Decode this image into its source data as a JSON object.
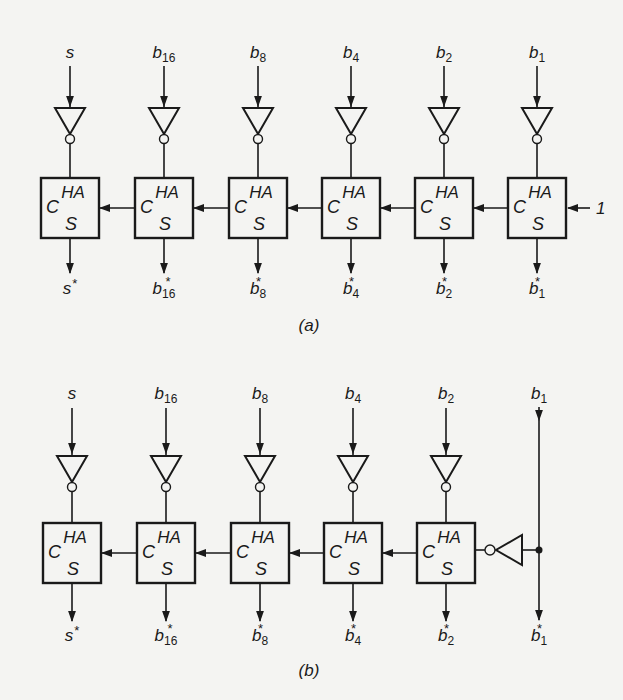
{
  "figure": {
    "panel_a": {
      "caption": "(a)",
      "stages": [
        {
          "input": "s",
          "input_sub": "",
          "output": "s",
          "output_sub": "",
          "box_title": "HA",
          "carry": "C",
          "sum": "S"
        },
        {
          "input": "b",
          "input_sub": "16",
          "output": "b",
          "output_sub": "16",
          "box_title": "HA",
          "carry": "C",
          "sum": "S"
        },
        {
          "input": "b",
          "input_sub": "8",
          "output": "b",
          "output_sub": "8",
          "box_title": "HA",
          "carry": "C",
          "sum": "S"
        },
        {
          "input": "b",
          "input_sub": "4",
          "output": "b",
          "output_sub": "4",
          "box_title": "HA",
          "carry": "C",
          "sum": "S"
        },
        {
          "input": "b",
          "input_sub": "2",
          "output": "b",
          "output_sub": "2",
          "box_title": "HA",
          "carry": "C",
          "sum": "S"
        },
        {
          "input": "b",
          "input_sub": "1",
          "output": "b",
          "output_sub": "1",
          "box_title": "HA",
          "carry": "C",
          "sum": "S"
        }
      ],
      "carry_in": "1",
      "star": "*"
    },
    "panel_b": {
      "caption": "(b)",
      "stages": [
        {
          "input": "s",
          "input_sub": "",
          "output": "s",
          "output_sub": "",
          "box_title": "HA",
          "carry": "C",
          "sum": "S"
        },
        {
          "input": "b",
          "input_sub": "16",
          "output": "b",
          "output_sub": "16",
          "box_title": "HA",
          "carry": "C",
          "sum": "S"
        },
        {
          "input": "b",
          "input_sub": "8",
          "output": "b",
          "output_sub": "8",
          "box_title": "HA",
          "carry": "C",
          "sum": "S"
        },
        {
          "input": "b",
          "input_sub": "4",
          "output": "b",
          "output_sub": "4",
          "box_title": "HA",
          "carry": "C",
          "sum": "S"
        },
        {
          "input": "b",
          "input_sub": "2",
          "output": "b",
          "output_sub": "2",
          "box_title": "HA",
          "carry": "C",
          "sum": "S"
        }
      ],
      "passthrough": {
        "input": "b",
        "input_sub": "1",
        "output": "b",
        "output_sub": "1"
      },
      "star": "*"
    },
    "colors": {
      "ink": "#1a1a1a",
      "paper": "#f4f4f2"
    }
  }
}
